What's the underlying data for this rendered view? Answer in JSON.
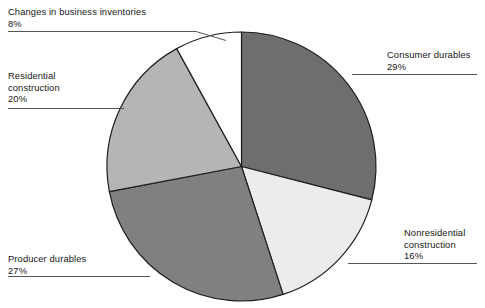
{
  "chart_data": {
    "type": "pie",
    "title": "",
    "categories": [
      "Consumer durables",
      "Nonresidential construction",
      "Producer durables",
      "Residential construction",
      "Changes in business inventories"
    ],
    "values": [
      29,
      16,
      27,
      20,
      8
    ],
    "value_unit": "%",
    "start_angle_deg": 0,
    "direction": "clockwise",
    "legend": "none",
    "grid": false,
    "colors": [
      "#6e6e6e",
      "#ececec",
      "#808080",
      "#b5b5b5",
      "#ffffff"
    ],
    "stroke_color": "#1f1f1f",
    "slices": [
      {
        "label": "Consumer durables",
        "value": 29,
        "display_value": "29%",
        "color": "#6e6e6e",
        "label_position": "right-top"
      },
      {
        "label": "Nonresidential construction",
        "value": 16,
        "display_value": "16%",
        "color": "#ececec",
        "label_position": "right-bottom"
      },
      {
        "label": "Producer durables",
        "value": 27,
        "display_value": "27%",
        "color": "#808080",
        "label_position": "left-bottom"
      },
      {
        "label": "Residential construction",
        "value": 20,
        "display_value": "20%",
        "color": "#b5b5b5",
        "label_position": "left-middle"
      },
      {
        "label": "Changes in business inventories",
        "value": 8,
        "display_value": "8%",
        "color": "#ffffff",
        "label_position": "left-top"
      }
    ]
  },
  "labels": {
    "inventories": {
      "line1": "Changes in business inventories",
      "pct": "8%"
    },
    "residential": {
      "line1": "Residential",
      "line2": "construction",
      "pct": "20%"
    },
    "producer": {
      "line1": "Producer durables",
      "pct": "27%"
    },
    "consumer": {
      "line1": "Consumer durables",
      "pct": "29%"
    },
    "nonresidential": {
      "line1": "Nonresidential",
      "line2": "construction",
      "pct": "16%"
    }
  }
}
